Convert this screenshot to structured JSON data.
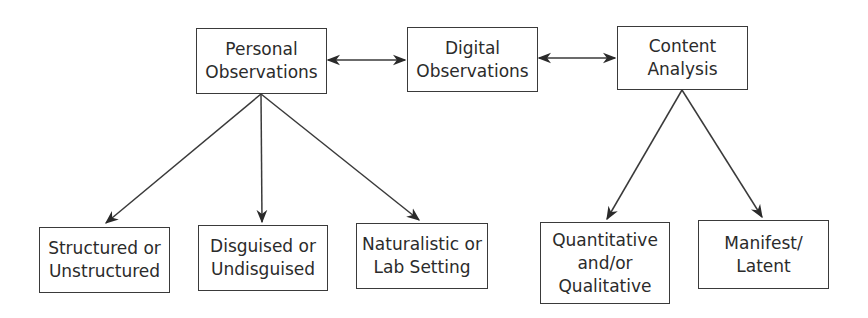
{
  "diagram": {
    "colors": {
      "stroke": "#3a3a3a",
      "text": "#2b2b2b",
      "background": "#ffffff"
    },
    "nodes": {
      "personal": {
        "line1": "Personal",
        "line2": "Observations"
      },
      "digital": {
        "line1": "Digital",
        "line2": "Observations"
      },
      "content": {
        "line1": "Content",
        "line2": "Analysis"
      },
      "structured": {
        "line1": "Structured or",
        "line2": "Unstructured"
      },
      "disguised": {
        "line1": "Disguised or",
        "line2": "Undisguised"
      },
      "naturalistic": {
        "line1": "Naturalistic or",
        "line2": "Lab Setting"
      },
      "quantitative": {
        "line1": "Quantitative",
        "line2": "and/or",
        "line3": "Qualitative"
      },
      "manifest": {
        "line1": "Manifest/",
        "line2": "Latent"
      }
    },
    "edges": [
      {
        "from": "personal",
        "to": "digital",
        "type": "bidirectional"
      },
      {
        "from": "digital",
        "to": "content",
        "type": "bidirectional"
      },
      {
        "from": "personal",
        "to": "structured",
        "type": "directed"
      },
      {
        "from": "personal",
        "to": "disguised",
        "type": "directed"
      },
      {
        "from": "personal",
        "to": "naturalistic",
        "type": "directed"
      },
      {
        "from": "content",
        "to": "quantitative",
        "type": "directed"
      },
      {
        "from": "content",
        "to": "manifest",
        "type": "directed"
      }
    ]
  }
}
